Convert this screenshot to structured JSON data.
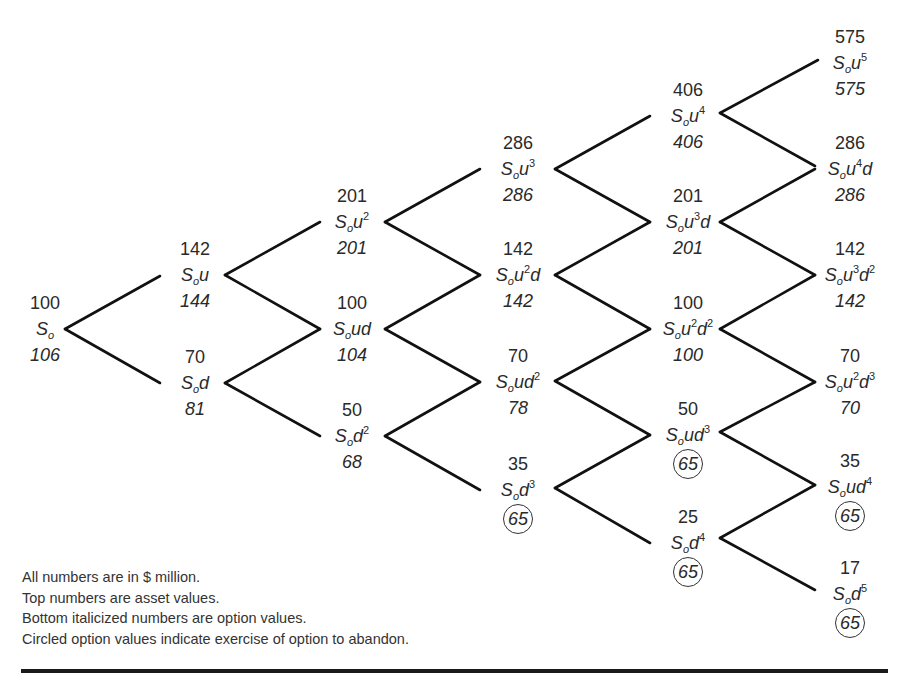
{
  "diagram": {
    "type": "binomial-tree",
    "line_color": "#111111",
    "nodes": [
      {
        "id": "n0",
        "col": 0,
        "x": 45,
        "y": 329,
        "asset": "100",
        "label_base": "S",
        "label_sub": "o",
        "label_rest": "",
        "label_parts": [],
        "option": "106",
        "circled": false
      },
      {
        "id": "n1u",
        "col": 1,
        "x": 195,
        "y": 275,
        "asset": "142",
        "label_parts": [
          [
            "u",
            ""
          ]
        ],
        "option": "144",
        "circled": false
      },
      {
        "id": "n1d",
        "col": 1,
        "x": 195,
        "y": 383,
        "asset": "70",
        "label_parts": [
          [
            "d",
            ""
          ]
        ],
        "option": "81",
        "circled": false
      },
      {
        "id": "n2a",
        "col": 2,
        "x": 352,
        "y": 222,
        "asset": "201",
        "label_parts": [
          [
            "u",
            "2"
          ]
        ],
        "option": "201",
        "circled": false
      },
      {
        "id": "n2b",
        "col": 2,
        "x": 352,
        "y": 329,
        "asset": "100",
        "label_parts": [
          [
            "ud",
            ""
          ]
        ],
        "option": "104",
        "circled": false
      },
      {
        "id": "n2c",
        "col": 2,
        "x": 352,
        "y": 436,
        "asset": "50",
        "label_parts": [
          [
            "d",
            "2"
          ]
        ],
        "option": "68",
        "circled": false
      },
      {
        "id": "n3a",
        "col": 3,
        "x": 518,
        "y": 169,
        "asset": "286",
        "label_parts": [
          [
            "u",
            "3"
          ]
        ],
        "option": "286",
        "circled": false
      },
      {
        "id": "n3b",
        "col": 3,
        "x": 518,
        "y": 275,
        "asset": "142",
        "label_parts": [
          [
            "u",
            "2"
          ],
          [
            "d",
            ""
          ]
        ],
        "option": "142",
        "circled": false
      },
      {
        "id": "n3c",
        "col": 3,
        "x": 518,
        "y": 382,
        "asset": "70",
        "label_parts": [
          [
            "ud",
            "2"
          ]
        ],
        "option": "78",
        "circled": false
      },
      {
        "id": "n3d",
        "col": 3,
        "x": 518,
        "y": 490,
        "asset": "35",
        "label_parts": [
          [
            "d",
            "3"
          ]
        ],
        "option": "65",
        "circled": true
      },
      {
        "id": "n4a",
        "col": 4,
        "x": 688,
        "y": 116,
        "asset": "406",
        "label_parts": [
          [
            "u",
            "4"
          ]
        ],
        "option": "406",
        "circled": false
      },
      {
        "id": "n4b",
        "col": 4,
        "x": 688,
        "y": 222,
        "asset": "201",
        "label_parts": [
          [
            "u",
            "3"
          ],
          [
            "d",
            ""
          ]
        ],
        "option": "201",
        "circled": false
      },
      {
        "id": "n4c",
        "col": 4,
        "x": 688,
        "y": 329,
        "asset": "100",
        "label_parts": [
          [
            "u",
            "2"
          ],
          [
            "d",
            "2"
          ]
        ],
        "option": "100",
        "circled": false
      },
      {
        "id": "n4d",
        "col": 4,
        "x": 688,
        "y": 435,
        "asset": "50",
        "label_parts": [
          [
            "ud",
            "3"
          ]
        ],
        "option": "65",
        "circled": true
      },
      {
        "id": "n4e",
        "col": 4,
        "x": 688,
        "y": 543,
        "asset": "25",
        "label_parts": [
          [
            "d",
            "4"
          ]
        ],
        "option": "65",
        "circled": true
      },
      {
        "id": "n5a",
        "col": 5,
        "x": 850,
        "y": 63,
        "asset": "575",
        "label_parts": [
          [
            "u",
            "5"
          ]
        ],
        "option": "575",
        "circled": false
      },
      {
        "id": "n5b",
        "col": 5,
        "x": 850,
        "y": 169,
        "asset": "286",
        "label_parts": [
          [
            "u",
            "4"
          ],
          [
            "d",
            ""
          ]
        ],
        "option": "286",
        "circled": false
      },
      {
        "id": "n5c",
        "col": 5,
        "x": 850,
        "y": 275,
        "asset": "142",
        "label_parts": [
          [
            "u",
            "3"
          ],
          [
            "d",
            "2"
          ]
        ],
        "option": "142",
        "circled": false
      },
      {
        "id": "n5d",
        "col": 5,
        "x": 850,
        "y": 382,
        "asset": "70",
        "label_parts": [
          [
            "u",
            "2"
          ],
          [
            "d",
            "3"
          ]
        ],
        "option": "70",
        "circled": false
      },
      {
        "id": "n5e",
        "col": 5,
        "x": 850,
        "y": 487,
        "asset": "35",
        "label_parts": [
          [
            "ud",
            "4"
          ]
        ],
        "option": "65",
        "circled": true
      },
      {
        "id": "n5f",
        "col": 5,
        "x": 850,
        "y": 594,
        "asset": "17",
        "label_parts": [
          [
            "d",
            "5"
          ]
        ],
        "option": "65",
        "circled": true
      }
    ],
    "branches": [
      [
        65,
        329,
        160,
        276
      ],
      [
        65,
        329,
        160,
        383
      ],
      [
        225,
        275,
        320,
        222
      ],
      [
        225,
        275,
        320,
        329
      ],
      [
        225,
        383,
        320,
        329
      ],
      [
        225,
        383,
        320,
        436
      ],
      [
        385,
        222,
        480,
        169
      ],
      [
        385,
        222,
        480,
        275
      ],
      [
        385,
        329,
        480,
        275
      ],
      [
        385,
        329,
        480,
        382
      ],
      [
        385,
        436,
        480,
        382
      ],
      [
        385,
        436,
        480,
        490
      ],
      [
        555,
        169,
        650,
        116
      ],
      [
        555,
        169,
        650,
        222
      ],
      [
        555,
        275,
        650,
        222
      ],
      [
        555,
        275,
        650,
        329
      ],
      [
        555,
        381,
        650,
        329
      ],
      [
        555,
        381,
        650,
        435
      ],
      [
        555,
        488,
        650,
        435
      ],
      [
        555,
        488,
        650,
        543
      ],
      [
        720,
        113,
        818,
        60
      ],
      [
        720,
        113,
        815,
        166
      ],
      [
        720,
        222,
        815,
        169
      ],
      [
        720,
        222,
        815,
        275
      ],
      [
        720,
        329,
        815,
        275
      ],
      [
        720,
        329,
        815,
        382
      ],
      [
        720,
        432,
        815,
        382
      ],
      [
        720,
        432,
        815,
        485
      ],
      [
        720,
        538,
        815,
        485
      ],
      [
        720,
        538,
        815,
        590
      ]
    ]
  },
  "notes": [
    "All numbers are in $ million.",
    "Top numbers are asset values.",
    "Bottom italicized numbers are option values.",
    "Circled option values indicate exercise of option to abandon."
  ]
}
